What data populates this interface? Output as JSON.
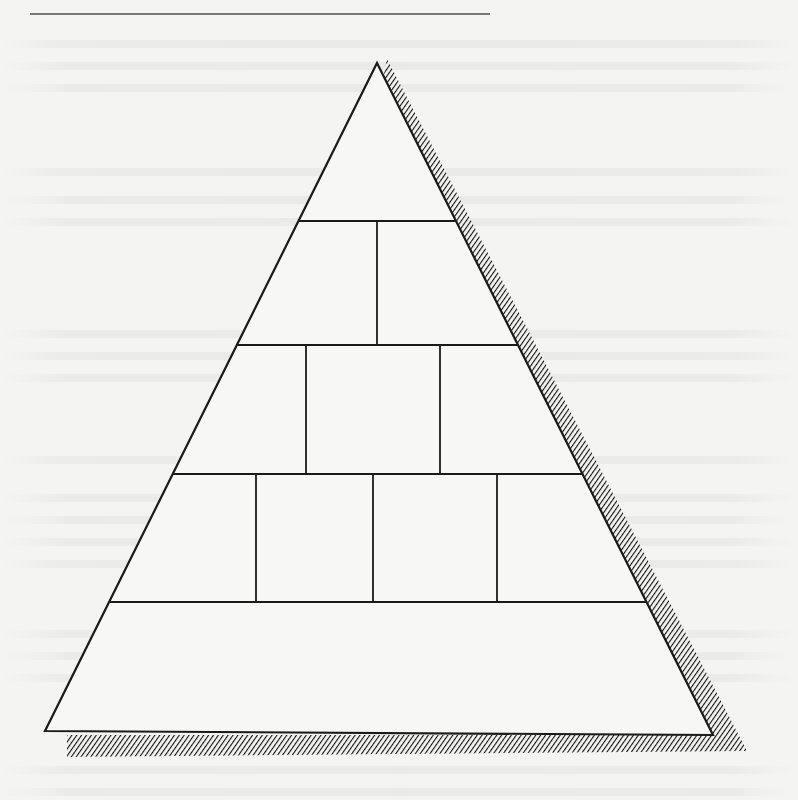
{
  "figure": {
    "type": "pyramid-diagram",
    "colors": {
      "paper": "#f4f4f2",
      "ink": "#1a1a1a",
      "rule": "#7a7a7a"
    },
    "top_rule": {
      "x1": 30,
      "x2": 490,
      "y": 14
    },
    "triangle": {
      "apex": [
        377,
        63
      ],
      "base_left": [
        45,
        731
      ],
      "base_right": [
        713,
        735
      ]
    },
    "tiers": [
      {
        "index": 1,
        "y_top": 63,
        "y_bottom": 221,
        "compartments": 1,
        "dividers_x": []
      },
      {
        "index": 2,
        "y_top": 221,
        "y_bottom": 345,
        "compartments": 2,
        "dividers_x": [
          377
        ]
      },
      {
        "index": 3,
        "y_top": 345,
        "y_bottom": 474,
        "compartments": 3,
        "dividers_x": [
          306,
          440
        ]
      },
      {
        "index": 4,
        "y_top": 474,
        "y_bottom": 602,
        "compartments": 4,
        "dividers_x": [
          256,
          373,
          497
        ]
      },
      {
        "index": 5,
        "y_top": 602,
        "y_bottom": 733,
        "compartments": 1,
        "dividers_x": []
      }
    ],
    "compartment_labels": []
  }
}
